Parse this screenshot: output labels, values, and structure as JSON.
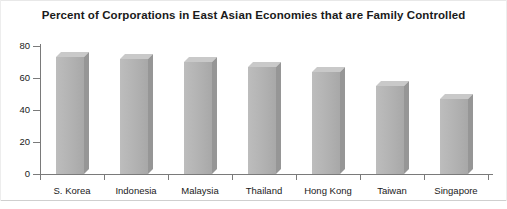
{
  "chart_data": {
    "type": "bar",
    "title": "Percent of Corporations in East Asian Economies that are Family Controlled",
    "xlabel": "",
    "ylabel": "",
    "categories": [
      "S. Korea",
      "Indonesia",
      "Malaysia",
      "Thailand",
      "Hong Kong",
      "Taiwan",
      "Singapore"
    ],
    "values": [
      73,
      72,
      70,
      67,
      64,
      55,
      47
    ],
    "ylim": [
      0,
      80
    ],
    "yticks": [
      0,
      20,
      40,
      60,
      80
    ],
    "ytick_labels": [
      "0",
      "20",
      "40",
      "60",
      "80"
    ],
    "grid": false,
    "legend": null,
    "bar_style": "3d-shaded-gray",
    "colors": {
      "bar_front": "#b3b3b3",
      "bar_top": "#c9c9c9",
      "bar_side": "#969696",
      "axis": "#7a7a7a",
      "text": "#1a1a1a",
      "background": "#ffffff"
    }
  }
}
